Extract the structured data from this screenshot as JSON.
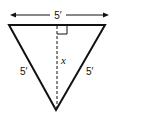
{
  "figure": {
    "type": "isosceles-triangle-altitude",
    "top_width_label": "5′",
    "left_side_label": "5′",
    "right_side_label": "5′",
    "altitude_label": "x",
    "has_right_angle_marker": true,
    "altitude_style": "dashed",
    "line_color": "#111111",
    "background": "#ffffff"
  }
}
